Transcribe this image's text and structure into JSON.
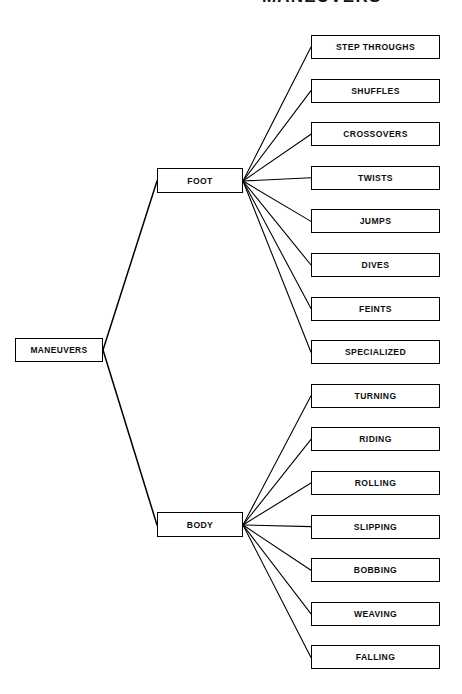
{
  "diagram": {
    "title_fragment": "MANEUVERS",
    "type": "hierarchical-tree",
    "orientation": "left-to-right",
    "root": {
      "label": "MANEUVERS"
    },
    "branches": [
      {
        "label": "FOOT"
      },
      {
        "label": "BODY"
      }
    ],
    "leaves": [
      {
        "label": "STEP THROUGHS",
        "parent": "FOOT"
      },
      {
        "label": "SHUFFLES",
        "parent": "FOOT"
      },
      {
        "label": "CROSSOVERS",
        "parent": "FOOT"
      },
      {
        "label": "TWISTS",
        "parent": "FOOT"
      },
      {
        "label": "JUMPS",
        "parent": "FOOT"
      },
      {
        "label": "DIVES",
        "parent": "FOOT"
      },
      {
        "label": "FEINTS",
        "parent": "FOOT"
      },
      {
        "label": "SPECIALIZED",
        "parent": "FOOT"
      },
      {
        "label": "TURNING",
        "parent": "BODY"
      },
      {
        "label": "RIDING",
        "parent": "BODY"
      },
      {
        "label": "ROLLING",
        "parent": "BODY"
      },
      {
        "label": "SLIPPING",
        "parent": "BODY"
      },
      {
        "label": "BOBBING",
        "parent": "BODY"
      },
      {
        "label": "WEAVING",
        "parent": "BODY"
      },
      {
        "label": "FALLING",
        "parent": "BODY"
      }
    ],
    "colors": {
      "background": "#ffffff",
      "stroke": "#000000",
      "text": "#0d0d0d"
    }
  }
}
